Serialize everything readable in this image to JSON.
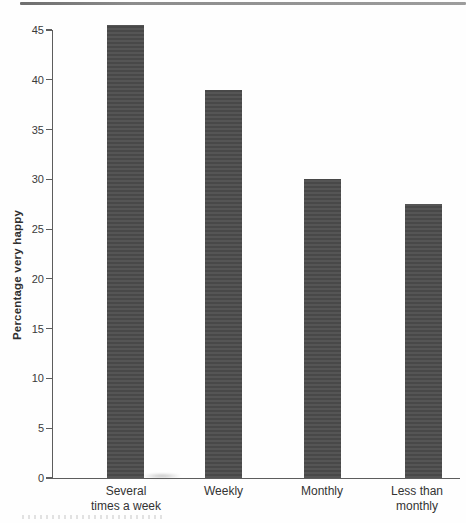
{
  "page": {
    "kind": "scanned book figure",
    "background_color": "#fefefe",
    "top_rule_color": "#8c8c8c"
  },
  "chart_data": {
    "type": "bar",
    "title": "",
    "xlabel": "",
    "ylabel": "Percentage very happy",
    "categories": [
      "Several times a week",
      "Weekly",
      "Monthly",
      "Less than monthly"
    ],
    "category_lines": [
      [
        "Several",
        "times a week"
      ],
      [
        "Weekly"
      ],
      [
        "Monthly"
      ],
      [
        "Less than",
        "monthly"
      ]
    ],
    "values": [
      45.5,
      39,
      30,
      27.5
    ],
    "ylim": [
      0,
      45
    ],
    "yticks": [
      0,
      5,
      10,
      15,
      20,
      25,
      30,
      35,
      40,
      45
    ],
    "grid": false,
    "legend": null,
    "bar_color": "#4c4c4c",
    "axis_color": "#5d5d5d",
    "text_color": "#333333"
  }
}
